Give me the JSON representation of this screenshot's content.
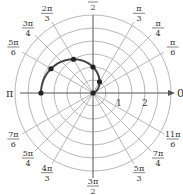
{
  "diagram": {
    "type": "polar-graph",
    "origin": [
      93,
      93
    ],
    "scale_px_per_unit": 26,
    "ring_step": 0.5,
    "ring_count": 6,
    "colors": {
      "grid": "#b8b8b8",
      "axis": "#555555",
      "curve": "#444444",
      "point": "#222222",
      "text": "#333333"
    },
    "axis_labels": {
      "zero": "0",
      "pi": "π",
      "half_pi": {
        "num": "π",
        "den": "2"
      },
      "three_half_pi": {
        "num": "3π",
        "den": "2"
      }
    },
    "radial_ticks": [
      "1",
      "2"
    ],
    "angle_labels": [
      {
        "num": "π",
        "den": "3",
        "angle_deg": 60
      },
      {
        "num": "π",
        "den": "4",
        "angle_deg": 45
      },
      {
        "num": "π",
        "den": "6",
        "angle_deg": 30
      },
      {
        "num": "2π",
        "den": "3",
        "angle_deg": 120
      },
      {
        "num": "3π",
        "den": "4",
        "angle_deg": 135
      },
      {
        "num": "5π",
        "den": "6",
        "angle_deg": 150
      },
      {
        "num": "7π",
        "den": "6",
        "angle_deg": 210
      },
      {
        "num": "5π",
        "den": "4",
        "angle_deg": 225
      },
      {
        "num": "4π",
        "den": "3",
        "angle_deg": 240
      },
      {
        "num": "5π",
        "den": "3",
        "angle_deg": 300
      },
      {
        "num": "7π",
        "den": "4",
        "angle_deg": 315
      },
      {
        "num": "11π",
        "den": "6",
        "angle_deg": 330
      }
    ],
    "curve": {
      "equation": "r = 1 - cos θ",
      "theta_range": [
        0,
        3.14159
      ],
      "points": [
        {
          "theta": "0",
          "r": 0
        },
        {
          "theta": "π/3",
          "r": 0.5
        },
        {
          "theta": "π/2",
          "r": 1
        },
        {
          "theta": "2π/3",
          "r": 1.5
        },
        {
          "theta": "5π/6",
          "r": 1.866
        },
        {
          "theta": "π",
          "r": 2
        }
      ]
    }
  }
}
